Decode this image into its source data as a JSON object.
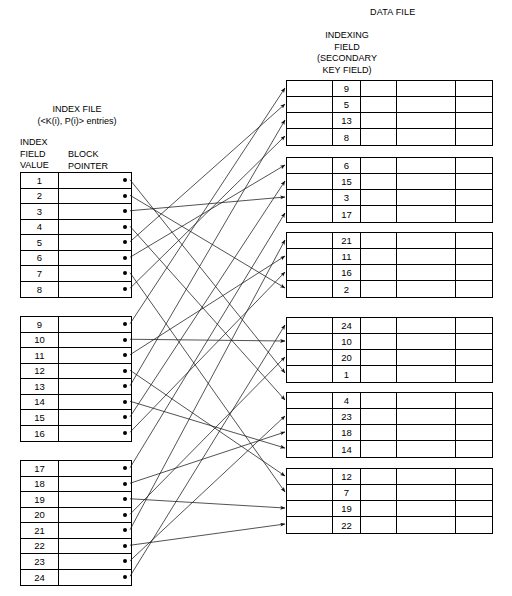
{
  "diagram": {
    "data_file_title": "DATA FILE",
    "indexing_field_caption": "INDEXING\nFIELD\n(SECONDARY\nKEY FIELD)",
    "index_file_title": "INDEX FILE\n(<K(i), P(i)> entries)",
    "index_value_caption": "INDEX\nFIELD\nVALUE",
    "block_pointer_caption": "BLOCK\nPOINTER",
    "line_color": "#1a1a1a",
    "pointer_dot_color": "#000000"
  },
  "index_file": {
    "blocks": [
      {
        "name": "index-block-1",
        "entries": [
          {
            "key": "1"
          },
          {
            "key": "2"
          },
          {
            "key": "3"
          },
          {
            "key": "4"
          },
          {
            "key": "5"
          },
          {
            "key": "6"
          },
          {
            "key": "7"
          },
          {
            "key": "8"
          }
        ]
      },
      {
        "name": "index-block-2",
        "entries": [
          {
            "key": "9"
          },
          {
            "key": "10"
          },
          {
            "key": "11"
          },
          {
            "key": "12"
          },
          {
            "key": "13"
          },
          {
            "key": "14"
          },
          {
            "key": "15"
          },
          {
            "key": "16"
          }
        ]
      },
      {
        "name": "index-block-3",
        "entries": [
          {
            "key": "17"
          },
          {
            "key": "18"
          },
          {
            "key": "19"
          },
          {
            "key": "20"
          },
          {
            "key": "21"
          },
          {
            "key": "22"
          },
          {
            "key": "23"
          },
          {
            "key": "24"
          }
        ]
      }
    ]
  },
  "data_file": {
    "columns_per_row": 5,
    "indexing_field_column_index": 2,
    "blocks": [
      {
        "name": "data-block-1",
        "values": [
          "9",
          "5",
          "13",
          "8"
        ]
      },
      {
        "name": "data-block-2",
        "values": [
          "6",
          "15",
          "3",
          "17"
        ]
      },
      {
        "name": "data-block-3",
        "values": [
          "21",
          "11",
          "16",
          "2"
        ]
      },
      {
        "name": "data-block-4",
        "values": [
          "24",
          "10",
          "20",
          "1"
        ]
      },
      {
        "name": "data-block-5",
        "values": [
          "4",
          "23",
          "18",
          "14"
        ]
      },
      {
        "name": "data-block-6",
        "values": [
          "12",
          "7",
          "19",
          "22"
        ]
      }
    ]
  },
  "pointers": [
    {
      "key": "1",
      "to_block": 4,
      "to_row": 4
    },
    {
      "key": "2",
      "to_block": 3,
      "to_row": 4
    },
    {
      "key": "3",
      "to_block": 2,
      "to_row": 3
    },
    {
      "key": "4",
      "to_block": 5,
      "to_row": 1
    },
    {
      "key": "5",
      "to_block": 1,
      "to_row": 2
    },
    {
      "key": "6",
      "to_block": 2,
      "to_row": 1
    },
    {
      "key": "7",
      "to_block": 6,
      "to_row": 2
    },
    {
      "key": "8",
      "to_block": 1,
      "to_row": 4
    },
    {
      "key": "9",
      "to_block": 1,
      "to_row": 1
    },
    {
      "key": "10",
      "to_block": 4,
      "to_row": 2
    },
    {
      "key": "11",
      "to_block": 3,
      "to_row": 2
    },
    {
      "key": "12",
      "to_block": 6,
      "to_row": 1
    },
    {
      "key": "13",
      "to_block": 1,
      "to_row": 3
    },
    {
      "key": "14",
      "to_block": 5,
      "to_row": 4
    },
    {
      "key": "15",
      "to_block": 2,
      "to_row": 2
    },
    {
      "key": "16",
      "to_block": 3,
      "to_row": 3
    },
    {
      "key": "17",
      "to_block": 2,
      "to_row": 4
    },
    {
      "key": "18",
      "to_block": 5,
      "to_row": 3
    },
    {
      "key": "19",
      "to_block": 6,
      "to_row": 3
    },
    {
      "key": "20",
      "to_block": 4,
      "to_row": 3
    },
    {
      "key": "21",
      "to_block": 3,
      "to_row": 1
    },
    {
      "key": "22",
      "to_block": 6,
      "to_row": 4
    },
    {
      "key": "23",
      "to_block": 5,
      "to_row": 2
    },
    {
      "key": "24",
      "to_block": 4,
      "to_row": 1
    }
  ]
}
